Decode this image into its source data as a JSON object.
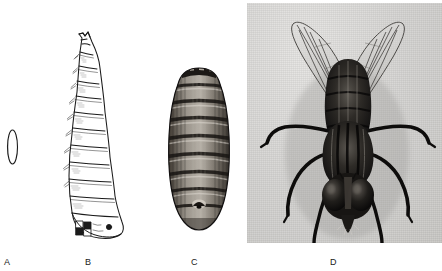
{
  "figure": {
    "background_color": "#ffffff",
    "width": 442,
    "height": 271,
    "panels": [
      {
        "key": "A",
        "label": "A",
        "subject": "egg",
        "caption": "egg",
        "style": "line drawing",
        "ink_color": "#1a1a1a",
        "bbox": [
          6,
          129,
          13,
          36
        ]
      },
      {
        "key": "B",
        "label": "B",
        "subject": "larva",
        "caption": "larva (maggot)",
        "style": "line drawing",
        "ink_color": "#1a1a1a",
        "segments": 12,
        "bbox": [
          52,
          28,
          78,
          218
        ]
      },
      {
        "key": "C",
        "label": "C",
        "subject": "pupa",
        "caption": "pupa (puparium)",
        "style": "stipple engraving",
        "ink_color": "#2a2622",
        "segments": 9,
        "bbox": [
          160,
          64,
          78,
          172
        ]
      },
      {
        "key": "D",
        "label": "D",
        "subject": "adult",
        "caption": "adult fly",
        "style": "halftone photograph",
        "photo_background": "#d9d9d7",
        "bbox": [
          247,
          3,
          195,
          240
        ]
      }
    ]
  }
}
